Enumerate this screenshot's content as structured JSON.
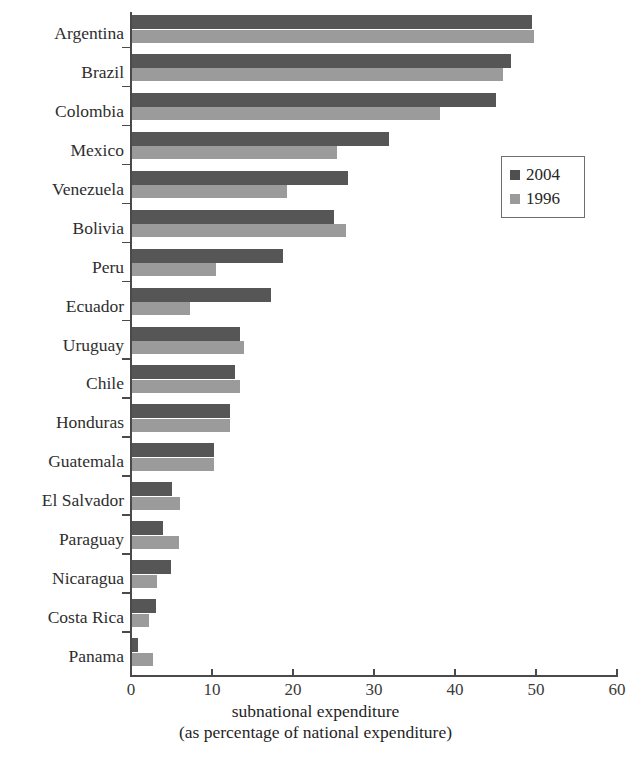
{
  "chart_data": {
    "type": "bar",
    "orientation": "horizontal",
    "title": "",
    "xlabel": "subnational expenditure (as percentage of national expenditure)",
    "xlabel_line1": "subnational expenditure",
    "xlabel_line2": "(as percentage of national expenditure)",
    "ylabel": "",
    "xlim": [
      0,
      60
    ],
    "xticks": [
      0,
      10,
      20,
      30,
      40,
      50,
      60
    ],
    "xtick_labels": [
      "0",
      "10",
      "20",
      "30",
      "40",
      "50",
      "60"
    ],
    "grid": false,
    "legend_position": "right-upper",
    "categories": [
      "Argentina",
      "Brazil",
      "Colombia",
      "Mexico",
      "Venezuela",
      "Bolivia",
      "Peru",
      "Ecuador",
      "Uruguay",
      "Chile",
      "Honduras",
      "Guatemala",
      "El Salvador",
      "Paraguay",
      "Nicaragua",
      "Costa Rica",
      "Panama"
    ],
    "series": [
      {
        "name": "2004",
        "color": "#565656",
        "values": [
          49.5,
          46.9,
          45.0,
          31.9,
          26.8,
          25.0,
          18.8,
          17.3,
          13.5,
          12.8,
          12.2,
          10.3,
          5.0,
          3.9,
          4.9,
          3.1,
          0.9
        ]
      },
      {
        "name": "1996",
        "color": "#9b9b9b",
        "values": [
          49.8,
          45.9,
          38.1,
          25.4,
          19.3,
          26.5,
          10.5,
          7.3,
          14.0,
          13.5,
          12.2,
          10.3,
          6.1,
          5.9,
          3.2,
          2.2,
          2.7
        ]
      }
    ]
  },
  "legend": {
    "items": [
      {
        "label": "2004",
        "color": "#4f4f4f"
      },
      {
        "label": "1996",
        "color": "#9b9b9b"
      }
    ]
  }
}
